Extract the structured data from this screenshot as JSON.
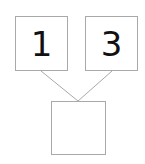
{
  "diagram": {
    "type": "number-bond",
    "background_color": "#ffffff",
    "border_color": "#a9a9a9",
    "text_color": "#111111",
    "parts": [
      {
        "id": "left",
        "value": "1"
      },
      {
        "id": "right",
        "value": "3"
      }
    ],
    "whole": {
      "id": "whole",
      "value": ""
    },
    "connectors": [
      {
        "from": "left",
        "to": "whole"
      },
      {
        "from": "right",
        "to": "whole"
      }
    ]
  }
}
